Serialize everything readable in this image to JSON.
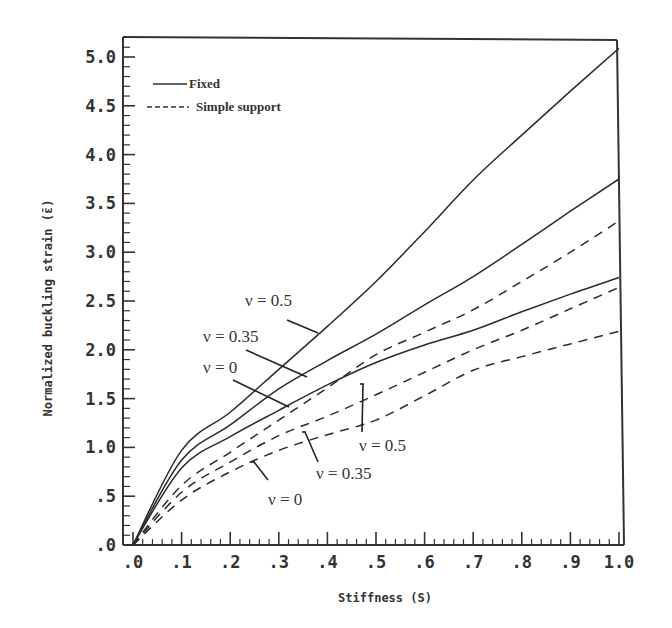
{
  "chart_data": {
    "type": "line",
    "title": "",
    "xlabel": "Stiffness (S)",
    "ylabel": "Normalized buckling strain (ε̄)",
    "xlim": [
      0,
      1.0
    ],
    "ylim": [
      0,
      5.2
    ],
    "grid": false,
    "legend_position": "upper left",
    "x_ticks": [
      ".0",
      ".1",
      ".2",
      ".3",
      ".4",
      ".5",
      ".6",
      ".7",
      ".8",
      ".9",
      "1.0"
    ],
    "y_ticks": [
      ".0",
      ".5",
      "1.0",
      "1.5",
      "2.0",
      "2.5",
      "3.0",
      "3.5",
      "4.0",
      "4.5",
      "5.0"
    ],
    "legend": [
      {
        "label": "Fixed",
        "style": "solid"
      },
      {
        "label": "Simple support",
        "style": "dashed"
      }
    ],
    "x": [
      0,
      0.1,
      0.2,
      0.3,
      0.4,
      0.5,
      0.6,
      0.7,
      0.8,
      0.9,
      1.0
    ],
    "series": [
      {
        "name": "Fixed, ν = 0.5",
        "style": "solid",
        "values": [
          0,
          0.97,
          1.36,
          1.8,
          2.24,
          2.7,
          3.21,
          3.74,
          4.2,
          4.65,
          5.09
        ]
      },
      {
        "name": "Fixed, ν = 0.35",
        "style": "solid",
        "values": [
          0,
          0.87,
          1.23,
          1.6,
          1.89,
          2.16,
          2.46,
          2.75,
          3.08,
          3.42,
          3.75
        ]
      },
      {
        "name": "Fixed, ν = 0",
        "style": "solid",
        "values": [
          0,
          0.79,
          1.11,
          1.38,
          1.64,
          1.87,
          2.05,
          2.2,
          2.39,
          2.57,
          2.74
        ]
      },
      {
        "name": "Simple support, ν = 0.5",
        "style": "dashed",
        "values": [
          0,
          0.61,
          0.95,
          1.28,
          1.61,
          1.95,
          2.18,
          2.41,
          2.7,
          3.0,
          3.32
        ]
      },
      {
        "name": "Simple support, ν = 0.35",
        "style": "dashed",
        "values": [
          0,
          0.54,
          0.85,
          1.12,
          1.32,
          1.54,
          1.77,
          2.0,
          2.2,
          2.42,
          2.64
        ]
      },
      {
        "name": "Simple support, ν = 0",
        "style": "dashed",
        "values": [
          0,
          0.46,
          0.75,
          0.97,
          1.13,
          1.28,
          1.53,
          1.79,
          1.93,
          2.06,
          2.19
        ]
      }
    ],
    "annotations": [
      {
        "text": "ν = 0.5",
        "group": "Fixed"
      },
      {
        "text": "ν = 0.35",
        "group": "Fixed"
      },
      {
        "text": "ν = 0",
        "group": "Fixed"
      },
      {
        "text": "ν = 0.5",
        "group": "Simple support"
      },
      {
        "text": "ν = 0.35",
        "group": "Simple support"
      },
      {
        "text": "ν = 0",
        "group": "Simple support"
      }
    ]
  }
}
